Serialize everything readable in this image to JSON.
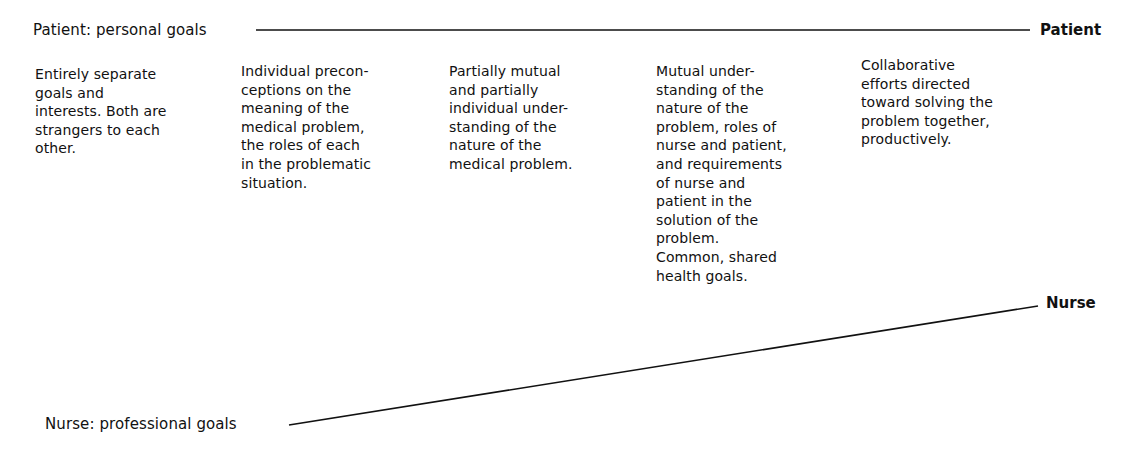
{
  "diagram": {
    "type": "converging-lines",
    "top_axis": {
      "start_label": "Patient: personal goals",
      "end_label": "Patient"
    },
    "bottom_axis": {
      "start_label": "Nurse: professional goals",
      "end_label": "Nurse"
    },
    "stages": [
      {
        "lines": [
          "Entirely separate",
          "goals and",
          "interests. Both are",
          "strangers to each",
          "other."
        ]
      },
      {
        "lines": [
          "Individual precon-",
          "ceptions on the",
          "meaning of the",
          "medical problem,",
          "the roles of each",
          "in the problematic",
          "situation."
        ]
      },
      {
        "lines": [
          "Partially mutual",
          "and partially",
          "individual under-",
          "standing of the",
          "nature of the",
          "medical problem."
        ]
      },
      {
        "lines": [
          "Mutual under-",
          "standing of the",
          "nature of the",
          "problem, roles of",
          "nurse and patient,",
          "and requirements",
          "of nurse and",
          "patient in the",
          "solution of the",
          "problem.",
          "Common, shared",
          "health goals."
        ]
      },
      {
        "lines": [
          "Collaborative",
          "efforts directed",
          "toward solving the",
          "problem together,",
          "productively."
        ]
      }
    ],
    "colors": {
      "ink": "#111111",
      "background": "#ffffff"
    }
  }
}
